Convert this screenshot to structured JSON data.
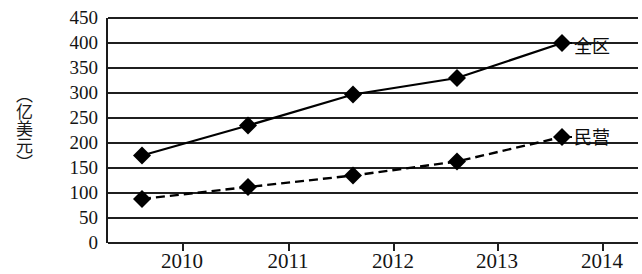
{
  "axes": {
    "y_unit_label": "（亿美元）",
    "y_ticks": [
      "450",
      "400",
      "350",
      "300",
      "250",
      "200",
      "150",
      "100",
      "50",
      "0"
    ],
    "x_ticks": [
      "2010",
      "2011",
      "2012",
      "2013",
      "2014"
    ]
  },
  "series_labels": {
    "total": "全区",
    "private": "民营"
  },
  "colors": {
    "axis": "#1f1f1f",
    "marker": "#000000",
    "line": "#000000",
    "background": "#ffffff"
  },
  "chart_data": {
    "type": "line",
    "title": "",
    "xlabel": "",
    "ylabel": "（亿美元）",
    "categories": [
      "2010",
      "2011",
      "2012",
      "2013",
      "2014"
    ],
    "x": [
      2010,
      2011,
      2012,
      2013,
      2014
    ],
    "ylim": [
      0,
      450
    ],
    "ytick_step": 50,
    "grid": true,
    "legend": "inline-right",
    "series": [
      {
        "name": "全区",
        "style": "solid",
        "marker": "diamond",
        "values": [
          175,
          235,
          297,
          330,
          400
        ]
      },
      {
        "name": "民营",
        "style": "dashed",
        "marker": "diamond",
        "values": [
          88,
          112,
          135,
          163,
          212
        ]
      }
    ]
  }
}
